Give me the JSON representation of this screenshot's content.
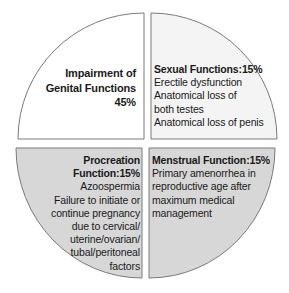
{
  "diagram": {
    "type": "quartered-circle",
    "colors": {
      "border": "#7a7a7a",
      "top_left_fill": "#ffffff",
      "top_right_fill": "#f4f4f4",
      "bottom_fill": "#d7d7d7"
    },
    "quadrants": {
      "top_left": {
        "lines": [
          "Impairment of",
          "Genital Functions",
          "45%"
        ]
      },
      "top_right": {
        "title": "Sexual Functions:15%",
        "lines": [
          "Erectile dysfunction",
          "Anatomical loss of",
          "both testes",
          "Anatomical loss of penis"
        ]
      },
      "bottom_left": {
        "title": "Procreation Function:15%",
        "lines": [
          "Azoospermia",
          "Failure to initiate or",
          "continue pregnancy",
          "due to cervical/",
          "uterine/ovarian/",
          "tubal/peritoneal",
          "factors"
        ]
      },
      "bottom_right": {
        "title": "Menstrual Function:15%",
        "lines": [
          "Primary amenorrhea in",
          "reproductive age after",
          "maximum medical",
          "management"
        ]
      }
    }
  }
}
